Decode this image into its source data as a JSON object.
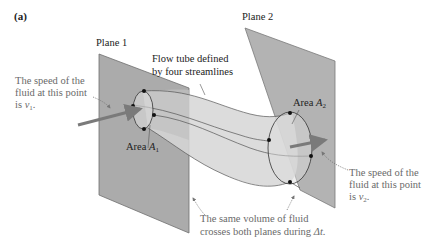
{
  "figure": {
    "panel_label": "(a)",
    "plane1_label": "Plane 1",
    "plane2_label": "Plane 2",
    "tube_label_line1": "Flow tube defined",
    "tube_label_line2": "by four streamlines",
    "area1_prefix": "Area ",
    "area1_var": "A",
    "area1_sub": "1",
    "area2_prefix": "Area ",
    "area2_var": "A",
    "area2_sub": "2",
    "speed1_line1": "The speed of the",
    "speed1_line2": "fluid at this point",
    "speed1_line3_prefix": "is ",
    "speed1_var": "v",
    "speed1_sub": "1",
    "speed1_suffix": ".",
    "speed2_line1": "The speed of the",
    "speed2_line2": "fluid at this point",
    "speed2_line3_prefix": "is ",
    "speed2_var": "v",
    "speed2_sub": "2",
    "speed2_suffix": ".",
    "volume_line1": "The same volume of fluid",
    "volume_line2_prefix": "crosses both planes during ",
    "volume_var": "Δt",
    "volume_suffix": "."
  },
  "colors": {
    "plane_fill": "#a9a9a9",
    "plane_stroke": "#6e6e6e",
    "tube_fill": "#d4d4d4",
    "arrow": "#7a7a7a",
    "note_text": "#6a6a6a",
    "label_text": "#222222"
  }
}
